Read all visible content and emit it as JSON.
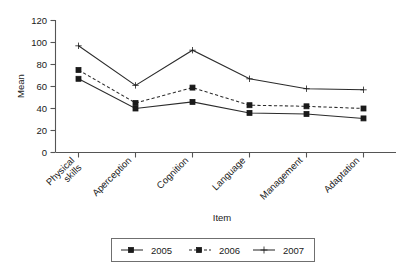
{
  "chart_data": {
    "type": "line",
    "title": "",
    "subtitle": "",
    "xlabel": "Item",
    "ylabel": "Mean",
    "categories": [
      "Physical skills",
      "Aperception",
      "Cognition",
      "Language",
      "Management",
      "Adaptation"
    ],
    "category_lines": [
      [
        "Physical",
        "skills"
      ],
      [
        "Aperception"
      ],
      [
        "Cognition"
      ],
      [
        "Language"
      ],
      [
        "Management"
      ],
      [
        "Adaptation"
      ]
    ],
    "ylim": [
      0,
      120
    ],
    "yticks": [
      0,
      20,
      40,
      60,
      80,
      100,
      120
    ],
    "ytick_labels": [
      "0",
      "20",
      "40",
      "60",
      "80",
      "100",
      "120"
    ],
    "grid": false,
    "legend_position": "bottom",
    "series": [
      {
        "name": "2005",
        "values": [
          67,
          40,
          46,
          36,
          35,
          31
        ],
        "line_style": "solid",
        "marker": "square",
        "color": "#2b2b2b"
      },
      {
        "name": "2006",
        "values": [
          75,
          45,
          59,
          43,
          42,
          40
        ],
        "line_style": "dashed",
        "marker": "square",
        "color": "#2b2b2b"
      },
      {
        "name": "2007",
        "values": [
          97,
          61,
          93,
          67,
          58,
          57
        ],
        "line_style": "solid",
        "marker": "plus",
        "color": "#2b2b2b"
      }
    ]
  },
  "legend": {
    "entries": [
      "2005",
      "2006",
      "2007"
    ]
  },
  "axes": {
    "x_title": "Item",
    "y_title": "Mean"
  }
}
